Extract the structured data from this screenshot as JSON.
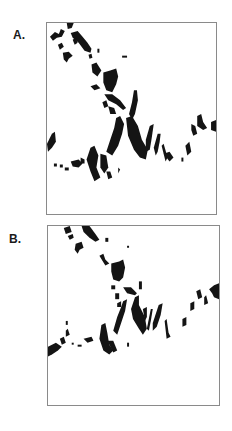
{
  "figure": {
    "panels": [
      {
        "label": "A."
      },
      {
        "label": "B."
      }
    ],
    "colors": {
      "foreground": "#141414",
      "background": "#ffffff",
      "frame": "#8a8a8a"
    }
  }
}
